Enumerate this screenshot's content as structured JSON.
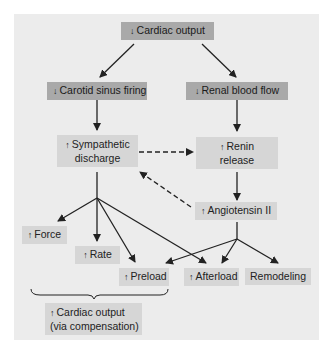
{
  "diagram": {
    "nodes": {
      "cardiac_output": {
        "arrow": "↓",
        "label": "Cardiac output"
      },
      "carotid": {
        "arrow": "↓",
        "label": "Carotid sinus firing"
      },
      "renal": {
        "arrow": "↓",
        "label": "Renal blood flow"
      },
      "sympathetic": {
        "arrow": "↑",
        "line1": "Sympathetic",
        "line2": "discharge"
      },
      "renin": {
        "arrow": "↑",
        "line1": "Renin",
        "line2": "release"
      },
      "angiotensin": {
        "arrow": "↑",
        "label": "Angiotensin II"
      },
      "force": {
        "arrow": "↑",
        "label": "Force"
      },
      "rate": {
        "arrow": "↑",
        "label": "Rate"
      },
      "preload": {
        "arrow": "↑",
        "label": "Preload"
      },
      "afterload": {
        "arrow": "↑",
        "label": "Afterload"
      },
      "remodeling": {
        "label": "Remodeling"
      },
      "compensation": {
        "arrow": "↑",
        "line1": "Cardiac output",
        "line2": "(via compensation)"
      }
    },
    "edges": [
      {
        "from": "cardiac_output",
        "to": "carotid",
        "style": "solid"
      },
      {
        "from": "cardiac_output",
        "to": "renal",
        "style": "solid"
      },
      {
        "from": "carotid",
        "to": "sympathetic",
        "style": "solid"
      },
      {
        "from": "renal",
        "to": "renin",
        "style": "solid"
      },
      {
        "from": "sympathetic",
        "to": "renin",
        "style": "dashed"
      },
      {
        "from": "angiotensin",
        "to": "sympathetic",
        "style": "dashed"
      },
      {
        "from": "renin",
        "to": "angiotensin",
        "style": "solid"
      },
      {
        "from": "sympathetic",
        "to": "force",
        "style": "solid"
      },
      {
        "from": "sympathetic",
        "to": "rate",
        "style": "solid"
      },
      {
        "from": "sympathetic",
        "to": "preload",
        "style": "solid"
      },
      {
        "from": "sympathetic",
        "to": "afterload",
        "style": "solid"
      },
      {
        "from": "angiotensin",
        "to": "preload",
        "style": "solid"
      },
      {
        "from": "angiotensin",
        "to": "afterload",
        "style": "solid"
      },
      {
        "from": "angiotensin",
        "to": "remodeling",
        "style": "solid"
      }
    ],
    "bracket": {
      "covers": [
        "force",
        "rate",
        "preload"
      ],
      "to": "compensation"
    },
    "colors": {
      "panel": "#ececec",
      "dark_box": "#a9a9a9",
      "light_box": "#d6d6d6",
      "line": "#222222"
    }
  }
}
